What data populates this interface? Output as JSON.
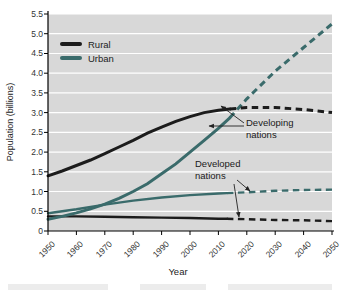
{
  "chart_data": {
    "type": "line",
    "title": "",
    "xlabel": "Year",
    "ylabel": "Population (billions)",
    "xlim": [
      1950,
      2050
    ],
    "ylim": [
      0,
      5.5
    ],
    "x_ticks": [
      1950,
      1960,
      1970,
      1980,
      1990,
      2000,
      2010,
      2020,
      2030,
      2040,
      2050
    ],
    "y_ticks": [
      0,
      0.5,
      1.0,
      1.5,
      2.0,
      2.5,
      3.0,
      3.5,
      4.0,
      4.5,
      5.0,
      5.5
    ],
    "grid": true,
    "plot_background": "#d8d8d8",
    "gridline_color": "#ffffff",
    "legend_position": "top-left-inside",
    "line_style_note": "solid = historical, dashed = projection after ~2013",
    "legend": [
      {
        "label": "Rural",
        "color": "#1c1c1c"
      },
      {
        "label": "Urban",
        "color": "#3a6b6b"
      }
    ],
    "annotations": [
      {
        "line1": "Developing",
        "line2": "nations",
        "points_to": [
          "developing rural line",
          "developing urban line"
        ]
      },
      {
        "line1": "Developed",
        "line2": "nations",
        "points_to": [
          "developed urban line",
          "developed rural line"
        ]
      }
    ],
    "series": [
      {
        "name": "Developed nations — Urban",
        "group": "Developed nations",
        "kind": "Urban",
        "color": "#3a6b6b",
        "width": 2.4,
        "solid": [
          [
            1950,
            0.45
          ],
          [
            1960,
            0.55
          ],
          [
            1970,
            0.67
          ],
          [
            1980,
            0.77
          ],
          [
            1990,
            0.85
          ],
          [
            2000,
            0.91
          ],
          [
            2010,
            0.95
          ],
          [
            2013,
            0.96
          ]
        ],
        "dashed": [
          [
            2013,
            0.96
          ],
          [
            2020,
            0.98
          ],
          [
            2030,
            1.02
          ],
          [
            2040,
            1.04
          ],
          [
            2050,
            1.05
          ]
        ]
      },
      {
        "name": "Developed nations — Rural",
        "group": "Developed nations",
        "kind": "Rural",
        "color": "#1c1c1c",
        "width": 2.4,
        "solid": [
          [
            1950,
            0.37
          ],
          [
            1960,
            0.37
          ],
          [
            1970,
            0.36
          ],
          [
            1980,
            0.35
          ],
          [
            1990,
            0.34
          ],
          [
            2000,
            0.33
          ],
          [
            2010,
            0.31
          ],
          [
            2013,
            0.31
          ]
        ],
        "dashed": [
          [
            2013,
            0.31
          ],
          [
            2020,
            0.3
          ],
          [
            2030,
            0.28
          ],
          [
            2040,
            0.27
          ],
          [
            2050,
            0.25
          ]
        ]
      },
      {
        "name": "Developing nations — Urban",
        "group": "Developing nations",
        "kind": "Urban",
        "color": "#3a6b6b",
        "width": 3,
        "solid": [
          [
            1950,
            0.3
          ],
          [
            1955,
            0.37
          ],
          [
            1960,
            0.46
          ],
          [
            1965,
            0.56
          ],
          [
            1970,
            0.68
          ],
          [
            1975,
            0.83
          ],
          [
            1980,
            1.0
          ],
          [
            1985,
            1.2
          ],
          [
            1990,
            1.45
          ],
          [
            1995,
            1.7
          ],
          [
            2000,
            2.0
          ],
          [
            2005,
            2.3
          ],
          [
            2010,
            2.6
          ],
          [
            2014,
            2.87
          ]
        ],
        "dashed": [
          [
            2014,
            2.87
          ],
          [
            2020,
            3.35
          ],
          [
            2030,
            4.05
          ],
          [
            2040,
            4.65
          ],
          [
            2050,
            5.25
          ]
        ]
      },
      {
        "name": "Developing nations — Rural",
        "group": "Developing nations",
        "kind": "Rural",
        "color": "#1c1c1c",
        "width": 3,
        "solid": [
          [
            1950,
            1.4
          ],
          [
            1955,
            1.52
          ],
          [
            1960,
            1.66
          ],
          [
            1965,
            1.8
          ],
          [
            1970,
            1.96
          ],
          [
            1975,
            2.13
          ],
          [
            1980,
            2.3
          ],
          [
            1985,
            2.48
          ],
          [
            1990,
            2.63
          ],
          [
            1995,
            2.78
          ],
          [
            2000,
            2.9
          ],
          [
            2005,
            3.0
          ],
          [
            2010,
            3.06
          ],
          [
            2014,
            3.09
          ]
        ],
        "dashed": [
          [
            2014,
            3.09
          ],
          [
            2020,
            3.13
          ],
          [
            2030,
            3.13
          ],
          [
            2040,
            3.08
          ],
          [
            2050,
            3.0
          ]
        ]
      }
    ]
  }
}
